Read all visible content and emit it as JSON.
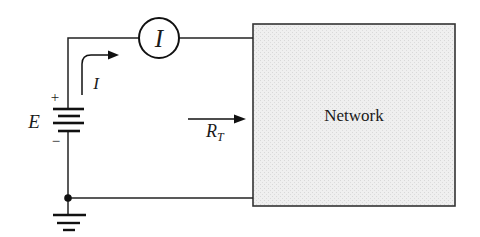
{
  "diagram": {
    "type": "circuit-schematic",
    "colors": {
      "wire": "#222222",
      "network_fill": "#ececec",
      "background": "#ffffff"
    },
    "source": {
      "label": "E",
      "plus_sign": "+",
      "minus_sign": "−"
    },
    "ammeter": {
      "label": "I"
    },
    "current_arrow": {
      "label": "I"
    },
    "resistance_arrow": {
      "label": "R",
      "subscript": "T"
    },
    "network_box": {
      "label": "Network"
    },
    "ground": {
      "symbol": "ground"
    }
  }
}
